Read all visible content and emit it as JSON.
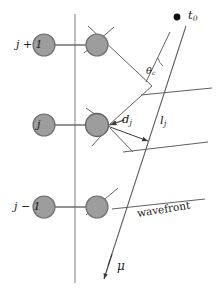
{
  "figure": {
    "kind": "wave-propagation-geometry-diagram",
    "background_color": "#ffffff",
    "line_color": "#555555",
    "axis_color": "#7a7a7a",
    "node_fill": "#9d9d9d",
    "node_stroke": "#6f6f6f",
    "source_dot_color": "#101010",
    "text_color": "#1a1a1a"
  },
  "labels": {
    "row_top": "j + 1",
    "row_middle": "j",
    "row_bottom": "j − 1",
    "source_time": "t",
    "source_time_sub": "0",
    "angle": "θ",
    "angle_sub": "c",
    "distance_d": "d",
    "distance_d_sub": "j",
    "distance_l": "l",
    "distance_l_sub": "j",
    "wavefront": "wavefront",
    "direction": "μ"
  },
  "geometry": {
    "vertical_axis": {
      "x": 75,
      "y_top": 14,
      "y_bottom": 283
    },
    "rows": [
      {
        "name": "j + 1",
        "y": 45,
        "left_node_x": 44,
        "right_node_x": 97
      },
      {
        "name": "j",
        "y": 125,
        "left_node_x": 44,
        "right_node_x": 97
      },
      {
        "name": "j − 1",
        "y": 207,
        "left_node_x": 44,
        "right_node_x": 97
      }
    ],
    "node_radius": 11,
    "source_point": {
      "x": 177,
      "y": 17
    },
    "mu_ray": {
      "x1": 186,
      "y1": 26,
      "x2": 104,
      "y2": 277
    },
    "wavefront_lines": [
      {
        "x1": 140,
        "y1": 95,
        "x2": 212,
        "y2": 88
      },
      {
        "x1": 123,
        "y1": 152,
        "x2": 208,
        "y2": 142
      },
      {
        "x1": 112,
        "y1": 208,
        "x2": 205,
        "y2": 199
      }
    ]
  }
}
